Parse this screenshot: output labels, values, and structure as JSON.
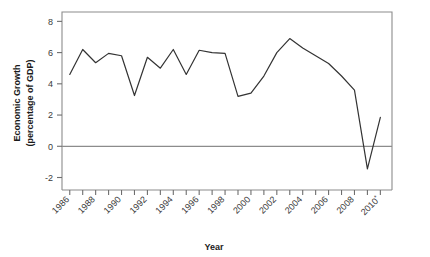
{
  "chart_data": {
    "type": "line",
    "title": "",
    "xlabel": "Year",
    "ylabel": "Economic Growth\n(percentage of GDP)",
    "ylabel_line1": "Economic Growth",
    "ylabel_line2": "(percentage of GDP)",
    "x": [
      1986,
      1987,
      1988,
      1989,
      1990,
      1991,
      1992,
      1993,
      1994,
      1995,
      1996,
      1997,
      1998,
      1999,
      2000,
      2001,
      2002,
      2003,
      2004,
      2005,
      2006,
      2007,
      2008,
      2009,
      2010
    ],
    "values": [
      4.6,
      6.2,
      5.35,
      5.95,
      5.8,
      3.25,
      5.7,
      5.0,
      6.2,
      4.6,
      6.15,
      6.0,
      5.95,
      3.2,
      3.4,
      4.5,
      6.0,
      6.9,
      6.3,
      5.8,
      5.3,
      4.5,
      3.6,
      -1.45,
      1.85
    ],
    "series": [
      {
        "name": "Economic Growth",
        "values": [
          4.6,
          6.2,
          5.35,
          5.95,
          5.8,
          3.25,
          5.7,
          5.0,
          6.2,
          4.6,
          6.15,
          6.0,
          5.95,
          3.2,
          3.4,
          4.5,
          6.0,
          6.9,
          6.3,
          5.8,
          5.3,
          4.5,
          3.6,
          -1.45,
          1.85
        ],
        "color": "#333333"
      }
    ],
    "y_ticks": [
      -2,
      0,
      2,
      4,
      6,
      8
    ],
    "y_tick_labels": [
      "-2",
      "0",
      "2",
      "4",
      "6",
      "8"
    ],
    "ylim": [
      -2.8,
      8.6
    ],
    "xlim": [
      1985.4,
      2010.9
    ],
    "x_tick_labels": [
      "1986",
      "1988",
      "1990",
      "1992",
      "1994",
      "1996",
      "1998",
      "2000",
      "2002",
      "2004",
      "2006",
      "2008",
      "2010"
    ],
    "x_tick_label_years": [
      1986,
      1988,
      1990,
      1992,
      1994,
      1996,
      1998,
      2000,
      2002,
      2004,
      2006,
      2008,
      2010
    ],
    "x_last_label_superscript": "*",
    "grid": false,
    "legend": "none",
    "zero_line": 0,
    "zero_line_color": "#8c8c8c",
    "frame_color": "#8c8c8c",
    "line_color": "#333333",
    "axis_tick_color": "#6e6e6e"
  }
}
